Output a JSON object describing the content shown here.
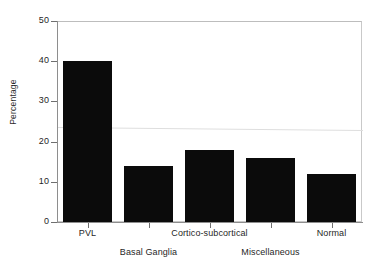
{
  "chart_data": {
    "type": "bar",
    "title": "",
    "xlabel": "",
    "ylabel": "Percentage",
    "categories": [
      "PVL",
      "Basal Ganglia",
      "Cortico-subcortical",
      "Miscellaneous",
      "Normal"
    ],
    "values": [
      40,
      14,
      18,
      16,
      12
    ],
    "ylim": [
      0,
      50
    ],
    "yticks": [
      0,
      10,
      20,
      30,
      40,
      50
    ],
    "ytick_labels": [
      "0",
      "10",
      "20",
      "30",
      "40",
      "50"
    ],
    "grid": false,
    "legend": null,
    "bar_color": "#0b0b0b",
    "background_color": "#ffffff",
    "label_rows": [
      "top",
      "bottom",
      "top",
      "bottom",
      "top"
    ],
    "annotations": []
  },
  "axes": {
    "y_title": "Percentage"
  }
}
